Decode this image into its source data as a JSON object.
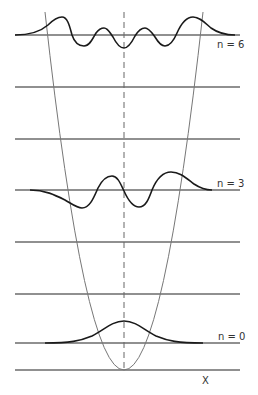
{
  "diagram": {
    "labels": {
      "n6": "n = 6",
      "n3": "n = 3",
      "n0": "n = 0",
      "x_axis": "X"
    },
    "energy_levels_y": [
      35,
      87,
      139,
      190,
      242,
      294,
      343
    ],
    "axis_y": 370,
    "center_x": 124,
    "colors": {
      "line": "#222222",
      "potential": "#777777",
      "wave": "#1a1a1a",
      "background": "#ffffff"
    }
  }
}
